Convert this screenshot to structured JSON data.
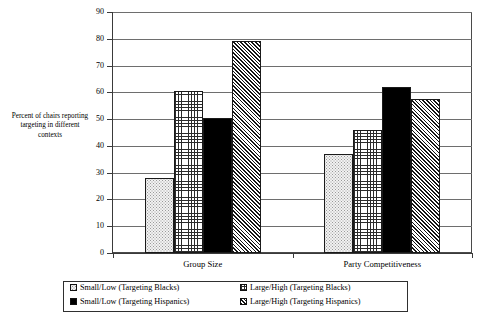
{
  "chart_data": {
    "type": "bar",
    "title": "",
    "subtitle": "",
    "xlabel": "",
    "ylabel": "Percent of chairs reporting targeting in different contexts",
    "ylabel_lines": [
      "Percent of chairs reporting",
      "targeting in different",
      "contexts"
    ],
    "categories": [
      "Group Size",
      "Party Competitiveness"
    ],
    "ylim": [
      0,
      90
    ],
    "yticks": [
      0,
      10,
      20,
      30,
      40,
      50,
      60,
      70,
      80,
      90
    ],
    "ytick_labels": [
      "0",
      "10",
      "20",
      "30",
      "40",
      "50",
      "60",
      "70",
      "80",
      "90"
    ],
    "grid": true,
    "grid_axis": "y",
    "legend_position": "bottom",
    "series": [
      {
        "name": "Small/Low (Targeting Blacks)",
        "pattern": "dotted",
        "fill": "#f2f2f2",
        "values": [
          28,
          37
        ]
      },
      {
        "name": "Large/High (Targeting Blacks)",
        "pattern": "cross-hatch-grid",
        "fill": "#ffffff",
        "values": [
          60.5,
          46
        ]
      },
      {
        "name": "Small/Low (Targeting Hispanics)",
        "pattern": "solid-black",
        "fill": "#000000",
        "values": [
          50.5,
          62
        ]
      },
      {
        "name": "Large/High (Targeting Hispanics)",
        "pattern": "diagonal-hatch",
        "fill": "#ffffff",
        "values": [
          79,
          57.5
        ]
      }
    ]
  },
  "legend": {
    "entries": [
      {
        "label": "Small/Low (Targeting Blacks)"
      },
      {
        "label": "Large/High (Targeting Blacks)"
      },
      {
        "label": "Small/Low (Targeting Hispanics)"
      },
      {
        "label": "Large/High (Targeting Hispanics)"
      }
    ]
  }
}
